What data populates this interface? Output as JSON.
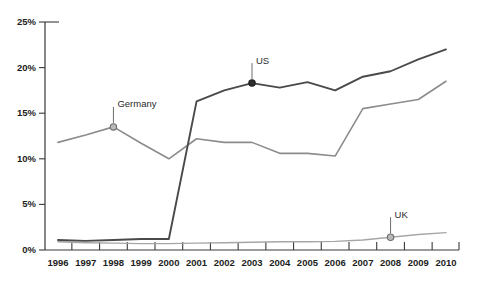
{
  "chart_data": {
    "type": "line",
    "title": "",
    "xlabel": "",
    "ylabel": "",
    "categories": [
      "1996",
      "1997",
      "1998",
      "1999",
      "2000",
      "2001",
      "2002",
      "2003",
      "2004",
      "2005",
      "2006",
      "2007",
      "2008",
      "2009",
      "2010"
    ],
    "x": [
      1996,
      1997,
      1998,
      1999,
      2000,
      2001,
      2002,
      2003,
      2004,
      2005,
      2006,
      2007,
      2008,
      2009,
      2010
    ],
    "xlim": [
      1996,
      2010
    ],
    "ylim": [
      0,
      25
    ],
    "yticks": [
      0,
      5,
      10,
      15,
      20,
      25
    ],
    "ytick_labels": [
      "0%",
      "5%",
      "10%",
      "15%",
      "20%",
      "25%"
    ],
    "grid": false,
    "legend": "inline-annotations",
    "series": [
      {
        "name": "US",
        "color": "#4a4a4a",
        "width": 1.9,
        "values": [
          1.1,
          1.0,
          1.1,
          1.2,
          1.2,
          16.3,
          17.5,
          18.3,
          17.8,
          18.4,
          17.5,
          19.0,
          19.6,
          20.9,
          22.0
        ],
        "marker_year": 2003,
        "marker_value": 18.3,
        "label": "US"
      },
      {
        "name": "Germany",
        "color": "#8c8c8c",
        "width": 1.6,
        "values": [
          11.8,
          12.6,
          13.5,
          11.7,
          10.0,
          12.2,
          11.8,
          11.8,
          10.6,
          10.6,
          10.3,
          15.5,
          16.0,
          16.5,
          18.5
        ],
        "marker_year": 1998,
        "marker_value": 13.5,
        "label": "Germany"
      },
      {
        "name": "UK",
        "color": "#a6a6a6",
        "width": 1.4,
        "values": [
          0.9,
          0.8,
          0.75,
          0.7,
          0.7,
          0.75,
          0.8,
          0.85,
          0.9,
          0.9,
          0.95,
          1.1,
          1.4,
          1.7,
          1.9
        ],
        "marker_year": 2008,
        "marker_value": 1.4,
        "label": "UK"
      }
    ],
    "annotations": [
      {
        "text": "Germany",
        "year": 1998,
        "value": 13.5
      },
      {
        "text": "US",
        "year": 2003,
        "value": 18.3
      },
      {
        "text": "UK",
        "year": 2008,
        "value": 1.4
      }
    ]
  },
  "colors": {
    "background": "#ffffff",
    "axis": "#3a3a3a",
    "text": "#1d1d1d",
    "us": "#4a4a4a",
    "germany": "#8c8c8c",
    "uk": "#a6a6a6"
  }
}
